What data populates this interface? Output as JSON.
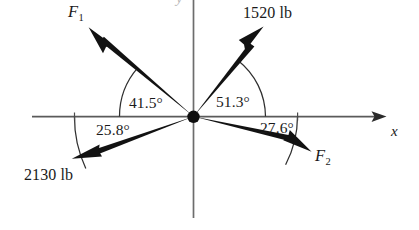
{
  "figure": {
    "kind": "free-body-force-diagram",
    "background_color": "#ffffff",
    "ink_color": "#151515",
    "axis_color": "#4a4a4a",
    "axes": {
      "x_label": "x",
      "y_label": "y",
      "origin_label": ""
    },
    "vectors": [
      {
        "name": "f1",
        "label": "F",
        "subscript": "1",
        "label_full": "F₁",
        "magnitude_text": "",
        "angle_deg": 41.5,
        "angle_text": "41.5°",
        "quadrant": "upper-left",
        "direction": "away-from-origin"
      },
      {
        "name": "force-1520",
        "label": "1520 lb",
        "subscript": "",
        "label_full": "1520 lb",
        "magnitude_text": "1520 lb",
        "angle_deg": 51.3,
        "angle_text": "51.3°",
        "quadrant": "upper-right",
        "direction": "away-from-origin"
      },
      {
        "name": "force-2130",
        "label": "2130 lb",
        "subscript": "",
        "label_full": "2130 lb",
        "magnitude_text": "2130 lb",
        "angle_deg": 25.8,
        "angle_text": "25.8°",
        "quadrant": "lower-left",
        "direction": "away-from-origin"
      },
      {
        "name": "f2",
        "label": "F",
        "subscript": "2",
        "label_full": "F₂",
        "magnitude_text": "",
        "angle_deg": 27.6,
        "angle_text": "27.6°",
        "quadrant": "lower-right",
        "direction": "away-from-origin"
      }
    ],
    "angle_labels": {
      "upper_left": "41.5°",
      "upper_right": "51.3°",
      "lower_left": "25.8°",
      "lower_right": "27.6°"
    },
    "magnitude_labels": {
      "upper_right": "1520 lb",
      "lower_left": "2130 lb"
    },
    "force_labels": {
      "upper_left_base": "F",
      "upper_left_sub": "1",
      "lower_right_base": "F",
      "lower_right_sub": "2"
    },
    "units": "lb"
  }
}
